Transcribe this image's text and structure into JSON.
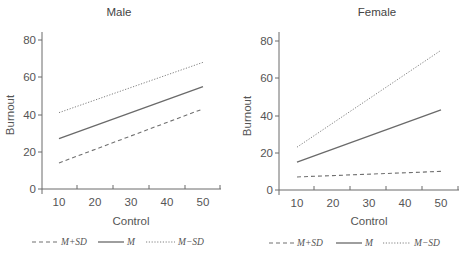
{
  "chart_data": [
    {
      "type": "line",
      "title": "Male",
      "xlabel": "Control",
      "ylabel": "Burnout",
      "x": [
        10,
        50
      ],
      "xticks": [
        "10",
        "20",
        "30",
        "40",
        "50"
      ],
      "yticks": [
        "0",
        "20",
        "40",
        "60",
        "80"
      ],
      "ylim": [
        0,
        80
      ],
      "xlim": [
        5,
        55
      ],
      "grid": false,
      "legend_position": "bottom",
      "series": [
        {
          "name": "M+SD",
          "style": "dashed",
          "values": [
            14,
            43
          ]
        },
        {
          "name": "M",
          "style": "solid",
          "values": [
            27,
            55
          ]
        },
        {
          "name": "M−SD",
          "style": "dotted",
          "values": [
            41,
            68
          ]
        }
      ]
    },
    {
      "type": "line",
      "title": "Female",
      "xlabel": "Control",
      "ylabel": "Burnout",
      "x": [
        10,
        50
      ],
      "xticks": [
        "10",
        "20",
        "30",
        "40",
        "50"
      ],
      "yticks": [
        "0",
        "20",
        "40",
        "60",
        "80"
      ],
      "ylim": [
        0,
        80
      ],
      "xlim": [
        5,
        55
      ],
      "grid": false,
      "legend_position": "bottom",
      "series": [
        {
          "name": "M+SD",
          "style": "dashed",
          "values": [
            7,
            10
          ]
        },
        {
          "name": "M",
          "style": "solid",
          "values": [
            15,
            43
          ]
        },
        {
          "name": "M−SD",
          "style": "dotted",
          "values": [
            23,
            75
          ]
        }
      ]
    }
  ],
  "panels": {
    "male": {
      "title": "Male",
      "xlabel": "Control",
      "ylabel": "Burnout"
    },
    "female": {
      "title": "Female",
      "xlabel": "Control",
      "ylabel": "Burnout"
    }
  },
  "ticks": {
    "x": [
      "10",
      "20",
      "30",
      "40",
      "50"
    ],
    "y": [
      "0",
      "20",
      "40",
      "60",
      "80"
    ]
  },
  "legend": {
    "plus": "M+SD",
    "mean": "M",
    "minus": "M−SD"
  }
}
